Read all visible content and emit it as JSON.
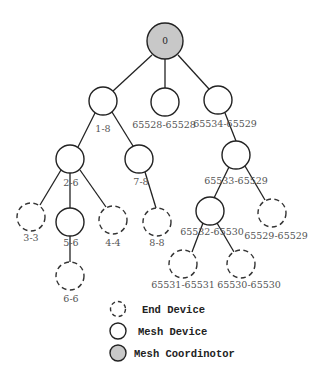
{
  "colors": {
    "coordinator_fill": "#c8c8c8",
    "stroke": "#222222",
    "label": "#555555"
  },
  "root": {
    "id": "0",
    "label": "0",
    "type": "coordinator"
  },
  "nodes": {
    "n1_8": {
      "label": "1-8",
      "type": "mesh"
    },
    "n65528": {
      "label": "65528-65528",
      "type": "mesh"
    },
    "n65534": {
      "label": "65534-65529",
      "type": "mesh"
    },
    "n2_6": {
      "label": "2-6",
      "type": "mesh"
    },
    "n7_8": {
      "label": "7-8",
      "type": "mesh"
    },
    "n3_3": {
      "label": "3-3",
      "type": "end"
    },
    "n5_6": {
      "label": "5-6",
      "type": "mesh"
    },
    "n4_4": {
      "label": "4-4",
      "type": "end"
    },
    "n8_8": {
      "label": "8-8",
      "type": "end"
    },
    "n6_6": {
      "label": "6-6",
      "type": "end"
    },
    "n65533": {
      "label": "65533-65529",
      "type": "mesh"
    },
    "n65532": {
      "label": "65532-65530",
      "type": "mesh"
    },
    "n65529": {
      "label": "65529-65529",
      "type": "end"
    },
    "n65531": {
      "label": "65531-65531",
      "type": "end"
    },
    "n65530": {
      "label": "65530-65530",
      "type": "end"
    }
  },
  "edges": [
    [
      "0",
      "1-8"
    ],
    [
      "0",
      "65528-65528"
    ],
    [
      "0",
      "65534-65529"
    ],
    [
      "1-8",
      "2-6"
    ],
    [
      "1-8",
      "7-8"
    ],
    [
      "2-6",
      "3-3"
    ],
    [
      "2-6",
      "5-6"
    ],
    [
      "2-6",
      "4-4"
    ],
    [
      "7-8",
      "8-8"
    ],
    [
      "5-6",
      "6-6"
    ],
    [
      "65534-65529",
      "65533-65529"
    ],
    [
      "65533-65529",
      "65532-65530"
    ],
    [
      "65533-65529",
      "65529-65529"
    ],
    [
      "65532-65530",
      "65531-65531"
    ],
    [
      "65532-65530",
      "65530-65530"
    ]
  ],
  "legend": {
    "items": [
      {
        "icon": "dashed-circle",
        "label": "End Device"
      },
      {
        "icon": "solid-circle",
        "label": "Mesh Device"
      },
      {
        "icon": "gray-filled-circle",
        "label": "Mesh Coordinotor"
      }
    ]
  }
}
